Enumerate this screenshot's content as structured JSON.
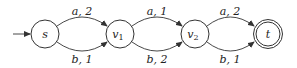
{
  "diagram": {
    "type": "automaton",
    "nodes": [
      {
        "id": "s",
        "label": "s",
        "initial": true,
        "accepting": false
      },
      {
        "id": "v1",
        "label": "v",
        "sub": "1",
        "initial": false,
        "accepting": false
      },
      {
        "id": "v2",
        "label": "v",
        "sub": "2",
        "initial": false,
        "accepting": false
      },
      {
        "id": "t",
        "label": "t",
        "initial": false,
        "accepting": true
      }
    ],
    "edges": [
      {
        "from": "s",
        "to": "v1",
        "symbol": "a",
        "weight": "2",
        "text": "a, 2",
        "position": "top"
      },
      {
        "from": "s",
        "to": "v1",
        "symbol": "b",
        "weight": "1",
        "text": "b, 1",
        "position": "bottom"
      },
      {
        "from": "v1",
        "to": "v2",
        "symbol": "a",
        "weight": "1",
        "text": "a, 1",
        "position": "top"
      },
      {
        "from": "v1",
        "to": "v2",
        "symbol": "b",
        "weight": "2",
        "text": "b, 2",
        "position": "bottom"
      },
      {
        "from": "v2",
        "to": "t",
        "symbol": "a",
        "weight": "2",
        "text": "a, 2",
        "position": "top"
      },
      {
        "from": "v2",
        "to": "t",
        "symbol": "b",
        "weight": "1",
        "text": "b, 1",
        "position": "bottom"
      }
    ]
  }
}
